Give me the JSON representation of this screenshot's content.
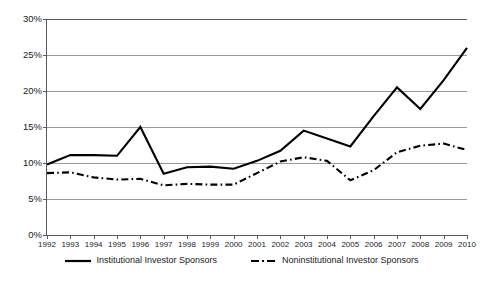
{
  "chart_data": {
    "type": "line",
    "title": "",
    "subtitle": "",
    "xlabel": "",
    "ylabel": "",
    "grid": true,
    "legend_position": "bottom",
    "ylim": [
      0,
      30
    ],
    "ytick_labels": [
      "30%",
      "25%",
      "20%",
      "15%",
      "10%",
      "5%",
      "0%"
    ],
    "ytick_values": [
      30,
      25,
      20,
      15,
      10,
      5,
      0
    ],
    "categories": [
      "1992",
      "1993",
      "1994",
      "1995",
      "1996",
      "1997",
      "1998",
      "1999",
      "2000",
      "2001",
      "2002",
      "2003",
      "2004",
      "2005",
      "2006",
      "2007",
      "2008",
      "2009",
      "2010"
    ],
    "x": [
      1992,
      1993,
      1994,
      1995,
      1996,
      1997,
      1998,
      1999,
      2000,
      2001,
      2002,
      2003,
      2004,
      2005,
      2006,
      2007,
      2008,
      2009,
      2010
    ],
    "series": [
      {
        "name": "Institutional Investor Sponsors",
        "style": "solid",
        "color": "#000000",
        "values": [
          9.8,
          11.1,
          11.1,
          11.0,
          15.0,
          8.5,
          9.4,
          9.5,
          9.2,
          10.3,
          11.7,
          14.5,
          13.4,
          12.3,
          16.5,
          20.5,
          17.5,
          21.5,
          26.0
        ]
      },
      {
        "name": "Noninstitutional Investor Sponsors",
        "style": "dash-dot",
        "color": "#000000",
        "values": [
          8.6,
          8.7,
          8.0,
          7.7,
          7.8,
          6.9,
          7.1,
          7.0,
          7.0,
          8.6,
          10.2,
          10.8,
          10.3,
          7.6,
          9.0,
          11.5,
          12.4,
          12.7,
          11.8
        ]
      }
    ]
  },
  "legend": {
    "entries": [
      {
        "label": "Institutional Investor Sponsors",
        "swatch": "solid-line-swatch"
      },
      {
        "label": "Noninstitutional Investor Sponsors",
        "swatch": "dash-dot-line-swatch"
      }
    ]
  }
}
